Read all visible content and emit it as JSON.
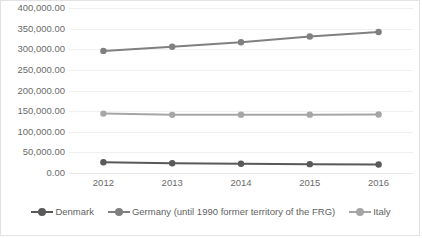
{
  "chart_data": {
    "type": "line",
    "title": "",
    "subtitle": "",
    "xlabel": "",
    "ylabel": "",
    "categories": [
      "2012",
      "2013",
      "2014",
      "2015",
      "2016"
    ],
    "ylim": [
      0,
      400000
    ],
    "y_ticks": [
      0,
      50000,
      100000,
      150000,
      200000,
      250000,
      300000,
      350000,
      400000
    ],
    "y_tick_labels": [
      "0.00",
      "50,000.00",
      "100,000.00",
      "150,000.00",
      "200,000.00",
      "250,000.00",
      "300,000.00",
      "350,000.00",
      "400,000.00"
    ],
    "grid": true,
    "legend_position": "bottom",
    "series": [
      {
        "name": "Denmark",
        "color": "#595959",
        "values": [
          26000,
          23500,
          22500,
          21500,
          20500
        ]
      },
      {
        "name": "Germany (until 1990 former territory of the FRG)",
        "color": "#808080",
        "values": [
          296000,
          306000,
          317000,
          331000,
          342000
        ]
      },
      {
        "name": "Italy",
        "color": "#a6a6a6",
        "values": [
          144000,
          141000,
          141500,
          141500,
          142000
        ]
      }
    ]
  },
  "legend": {
    "items": [
      {
        "label": "Denmark",
        "color": "#595959"
      },
      {
        "label": "Germany (until 1990 former territory of the FRG)",
        "color": "#808080"
      },
      {
        "label": "Italy",
        "color": "#a6a6a6"
      }
    ]
  }
}
